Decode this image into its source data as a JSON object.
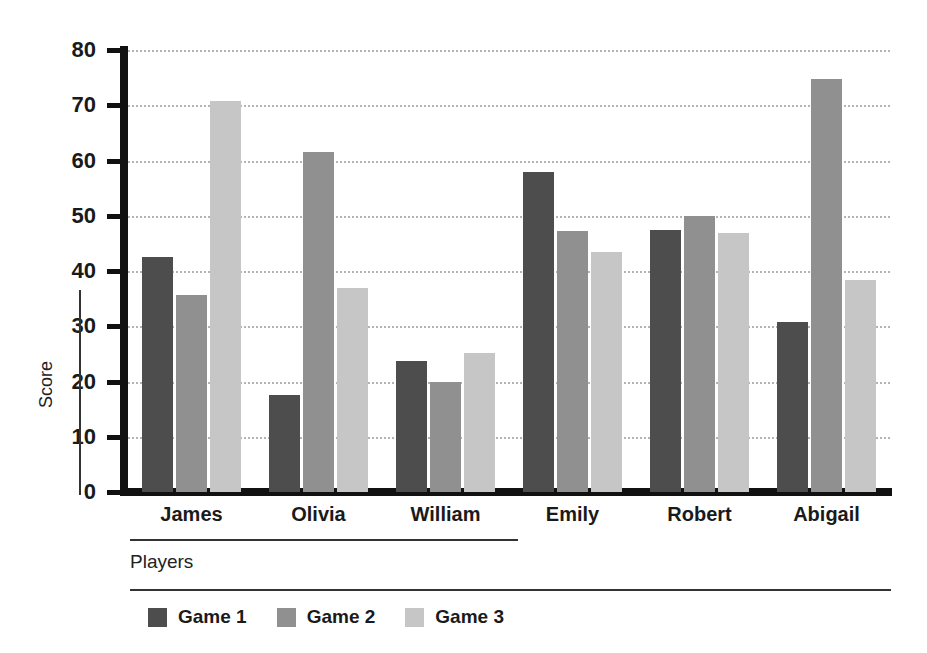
{
  "chart_data": {
    "type": "bar",
    "title": "",
    "xlabel": "Players",
    "ylabel": "Score",
    "categories": [
      "James",
      "Olivia",
      "William",
      "Emily",
      "Robert",
      "Abigail"
    ],
    "series": [
      {
        "name": "Game 1",
        "color": "#4d4d4d",
        "values": [
          42.5,
          17.6,
          23.7,
          58.0,
          47.4,
          30.8
        ]
      },
      {
        "name": "Game 2",
        "color": "#909090",
        "values": [
          35.6,
          61.5,
          19.9,
          47.3,
          50.0,
          74.8
        ]
      },
      {
        "name": "Game 3",
        "color": "#c6c6c6",
        "values": [
          70.8,
          36.9,
          25.1,
          43.4,
          46.9,
          38.4
        ]
      }
    ],
    "ylim": [
      0,
      80
    ],
    "yticks": [
      0,
      10,
      20,
      30,
      40,
      50,
      60,
      70,
      80
    ],
    "ytick_labels": [
      "0",
      "10",
      "20",
      "30",
      "40",
      "50",
      "60",
      "70",
      "80"
    ],
    "grid": "horizontal-dotted",
    "legend_position": "bottom",
    "legend_entries": [
      "Game 1",
      "Game 2",
      "Game 3"
    ]
  }
}
